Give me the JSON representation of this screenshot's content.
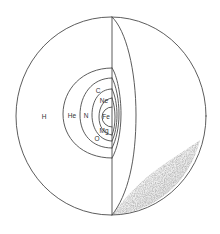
{
  "figure": {
    "type": "cutaway-sphere-diagram",
    "colors": {
      "line": "#4a4a4a",
      "text": "#333333",
      "shading": "#9a9a9a",
      "background": "#ffffff"
    },
    "labels": {
      "h": "H",
      "he": "He",
      "n": "N",
      "c": "C",
      "ne": "Ne",
      "fe": "Fe",
      "mg": "Mg",
      "o": "O"
    },
    "layers_outer_to_inner": [
      "H",
      "He",
      "N / C",
      "Ne / O",
      "Mg",
      "Fe"
    ]
  }
}
